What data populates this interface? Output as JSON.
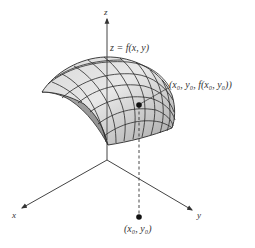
{
  "diagram": {
    "axes": {
      "x_label": "x",
      "y_label": "y",
      "z_label": "z"
    },
    "surface_label": "z = f(x, y)",
    "surface_point_label": "(x₀, y₀, f(x₀, y₀))",
    "domain_point_label": "(x₀, y₀)",
    "colors": {
      "surface_light": "#e6e6e6",
      "surface_dark": "#9a9a9a",
      "grid_lines": "#2a2a2a",
      "axis": "#444444",
      "point": "#111111"
    }
  }
}
